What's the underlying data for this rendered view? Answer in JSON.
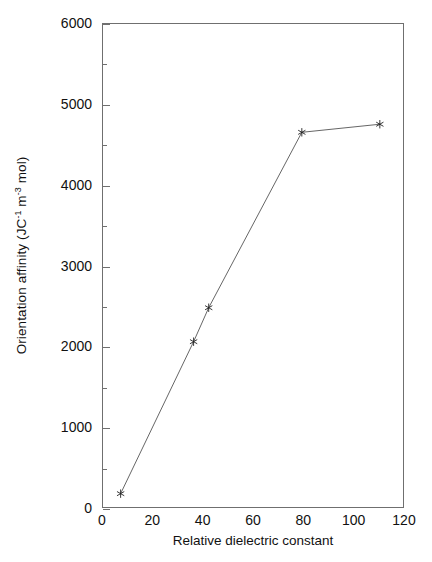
{
  "chart_data": {
    "type": "line",
    "title": "",
    "xlabel": "Relative dielectric constant",
    "ylabel_text": "Orientation affinity (JC",
    "ylabel_sup1": "-1",
    "ylabel_mid": " m",
    "ylabel_sup2": "-3",
    "ylabel_end": " mol)",
    "ylabel_plain": "Orientation affinity (JC-1 m-3 mol)",
    "x": [
      7,
      36,
      42,
      79,
      110
    ],
    "values": [
      190,
      2070,
      2490,
      4660,
      4760
    ],
    "series": [
      {
        "name": "Orientation affinity",
        "points": [
          {
            "x": 7,
            "y": 190
          },
          {
            "x": 36,
            "y": 2070
          },
          {
            "x": 42,
            "y": 2490
          },
          {
            "x": 79,
            "y": 4660
          },
          {
            "x": 110,
            "y": 4760
          }
        ]
      }
    ],
    "marker": "asterisk",
    "line_color": "#555555",
    "marker_color": "#222222",
    "xlim": [
      0,
      120
    ],
    "ylim": [
      0,
      6000
    ],
    "xticks": [
      0,
      20,
      40,
      60,
      80,
      100,
      120
    ],
    "xtick_labels": [
      "0",
      "20",
      "40",
      "60",
      "80",
      "100",
      "120"
    ],
    "yticks": [
      0,
      1000,
      2000,
      3000,
      4000,
      5000,
      6000
    ],
    "ytick_labels": [
      "0",
      "1000",
      "2000",
      "3000",
      "4000",
      "5000",
      "6000"
    ],
    "yticks_minor": [
      500,
      1500,
      2500,
      3500,
      4500,
      5500
    ],
    "grid": false,
    "legend": null,
    "axis_color": "#6f6f6f",
    "background": "#ffffff"
  }
}
